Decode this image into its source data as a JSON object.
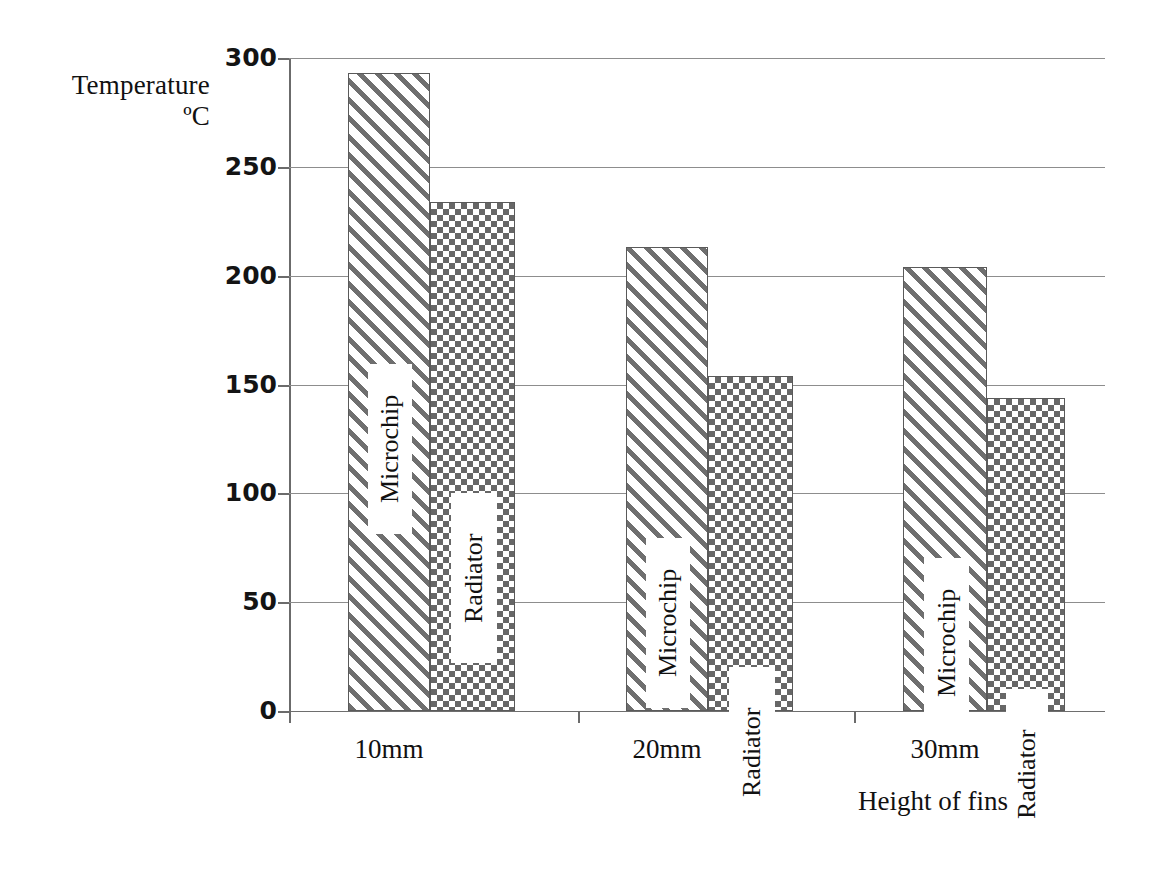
{
  "chart_data": {
    "type": "bar",
    "title": "",
    "xlabel": "Height of fins",
    "ylabel": "Temperature",
    "ylabel_units": "ºC",
    "categories": [
      "10mm",
      "20mm",
      "30mm"
    ],
    "series": [
      {
        "name": "Microchip",
        "values": [
          293,
          213,
          204
        ]
      },
      {
        "name": "Radiator",
        "values": [
          234,
          154,
          144
        ]
      }
    ],
    "ylim": [
      0,
      300
    ],
    "yticks": [
      0,
      50,
      100,
      150,
      200,
      250,
      300
    ],
    "ytick_labels": [
      "0",
      "50",
      "100",
      "150",
      "200",
      "250",
      "300"
    ],
    "grid": true,
    "legend": "in-bar-rotated-labels",
    "colors": {
      "microchip_pattern": "diagonal-hatch",
      "radiator_pattern": "checkerboard",
      "ink": "#1a1a1a",
      "gridline": "#8d8d8d",
      "axis": "#6b6b6b",
      "background": "#ffffff"
    }
  },
  "axes": {
    "y_title_line1": "Temperature",
    "y_title_line2": "ºC",
    "x_title": "Height of fins"
  },
  "ticks": {
    "y": [
      {
        "label": "300",
        "value": 300
      },
      {
        "label": "250",
        "value": 250
      },
      {
        "label": "200",
        "value": 200
      },
      {
        "label": "150",
        "value": 150
      },
      {
        "label": "100",
        "value": 100
      },
      {
        "label": "50",
        "value": 50
      },
      {
        "label": "0",
        "value": 0
      }
    ]
  },
  "groups": [
    {
      "category": "10mm",
      "bars": [
        {
          "series": "Microchip",
          "label": "Microchip",
          "value": 293
        },
        {
          "series": "Radiator",
          "label": "Radiator",
          "value": 234
        }
      ]
    },
    {
      "category": "20mm",
      "bars": [
        {
          "series": "Microchip",
          "label": "Microchip",
          "value": 213
        },
        {
          "series": "Radiator",
          "label": "Radiator",
          "value": 154
        }
      ]
    },
    {
      "category": "30mm",
      "bars": [
        {
          "series": "Microchip",
          "label": "Microchip",
          "value": 204
        },
        {
          "series": "Radiator",
          "label": "Radiator",
          "value": 144
        }
      ]
    }
  ]
}
